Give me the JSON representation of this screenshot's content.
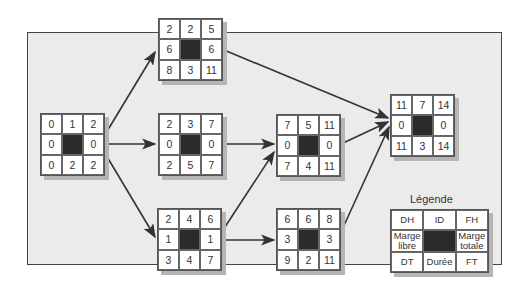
{
  "diagram": {
    "type": "activity-on-node network (PERT/CPM)",
    "nodes": [
      {
        "key": "start",
        "cells": {
          "dh": "0",
          "id": "",
          "fh": "2",
          "ml": "0",
          "mt": "0",
          "dt": "0",
          "duree": "2",
          "ft": "2"
        },
        "top": "1"
      },
      {
        "key": "a",
        "cells": {
          "dh": "2",
          "id": "",
          "fh": "5",
          "ml": "6",
          "mt": "6",
          "dt": "8",
          "duree": "3",
          "ft": "11"
        },
        "top": "2"
      },
      {
        "key": "b",
        "cells": {
          "dh": "2",
          "id": "",
          "fh": "7",
          "ml": "0",
          "mt": "0",
          "dt": "2",
          "duree": "5",
          "ft": "7"
        },
        "top": "3"
      },
      {
        "key": "c",
        "cells": {
          "dh": "2",
          "id": "",
          "fh": "6",
          "ml": "1",
          "mt": "1",
          "dt": "3",
          "duree": "4",
          "ft": "7"
        },
        "top": "4"
      },
      {
        "key": "d",
        "cells": {
          "dh": "7",
          "id": "",
          "fh": "11",
          "ml": "0",
          "mt": "0",
          "dt": "7",
          "duree": "4",
          "ft": "11"
        },
        "top": "5"
      },
      {
        "key": "e",
        "cells": {
          "dh": "6",
          "id": "",
          "fh": "8",
          "ml": "3",
          "mt": "3",
          "dt": "9",
          "duree": "2",
          "ft": "11"
        },
        "top": "6"
      },
      {
        "key": "end",
        "cells": {
          "dh": "11",
          "id": "",
          "fh": "14",
          "ml": "0",
          "mt": "0",
          "dt": "11",
          "duree": "3",
          "ft": "14"
        },
        "top": "7"
      }
    ],
    "edges": [
      {
        "from": "start",
        "to": "a"
      },
      {
        "from": "start",
        "to": "b"
      },
      {
        "from": "start",
        "to": "c"
      },
      {
        "from": "b",
        "to": "d"
      },
      {
        "from": "c",
        "to": "d"
      },
      {
        "from": "c",
        "to": "e"
      },
      {
        "from": "a",
        "to": "end"
      },
      {
        "from": "d",
        "to": "end"
      },
      {
        "from": "e",
        "to": "end"
      }
    ]
  },
  "legend": {
    "title": "Légende",
    "dh": "DH",
    "id": "ID",
    "fh": "FH",
    "marge_libre": "Marge libre",
    "marge_totale": "Marge totale",
    "dt": "DT",
    "duree": "Durée",
    "ft": "FT"
  }
}
